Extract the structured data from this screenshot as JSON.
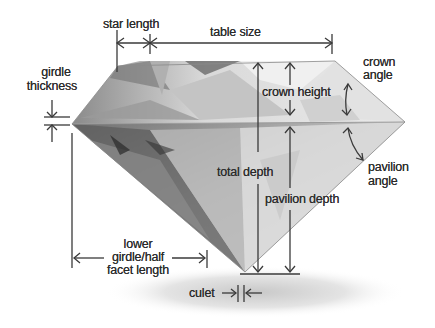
{
  "labels": {
    "star_length": "star length",
    "table_size": "table size",
    "girdle_thickness_line1": "girdle",
    "girdle_thickness_line2": "thickness",
    "crown_height": "crown height",
    "crown_angle_line1": "crown",
    "crown_angle_line2": "angle",
    "total_depth": "total depth",
    "pavilion_depth": "pavilion depth",
    "pavilion_angle_line1": "pavilion",
    "pavilion_angle_line2": "angle",
    "lower_girdle_line1": "lower",
    "lower_girdle_line2": "girdle/half",
    "lower_girdle_line3": "facet length",
    "culet": "culet"
  },
  "colors": {
    "line": "#3a3a3a",
    "text": "#2a2a2a",
    "background": "#ffffff"
  }
}
